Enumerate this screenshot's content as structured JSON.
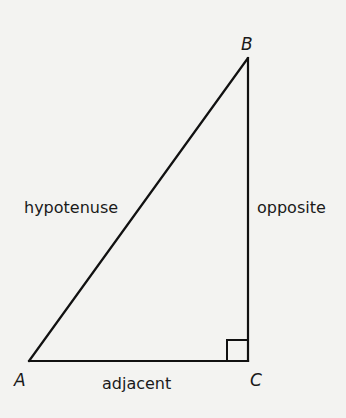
{
  "diagram": {
    "colors": {
      "background": "#f3f3f1",
      "stroke": "#111111",
      "text": "#1a1a1a"
    },
    "vertices": [
      {
        "id": "A",
        "label": "A",
        "x": 29,
        "y": 361,
        "label_x": 15,
        "label_y": 386
      },
      {
        "id": "B",
        "label": "B",
        "x": 248,
        "y": 58,
        "label_x": 241,
        "label_y": 50
      },
      {
        "id": "C",
        "label": "C",
        "x": 248,
        "y": 361,
        "label_x": 250,
        "label_y": 386
      }
    ],
    "sides": {
      "hypotenuse": {
        "label": "hypotenuse",
        "from": "A",
        "to": "B",
        "label_x": 25,
        "label_y": 212
      },
      "opposite": {
        "label": "opposite",
        "from": "B",
        "to": "C",
        "label_x": 257,
        "label_y": 212
      },
      "adjacent": {
        "label": "adjacent",
        "from": "A",
        "to": "C",
        "label_x": 102,
        "label_y": 390
      }
    },
    "right_angle_marker": {
      "at": "C",
      "size": 21
    }
  }
}
